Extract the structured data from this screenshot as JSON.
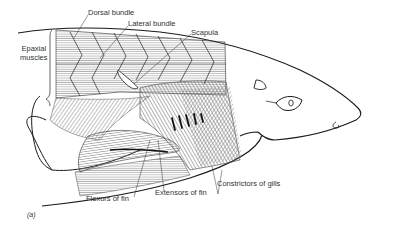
{
  "figure": {
    "panel_label": "(a)",
    "labels": {
      "dorsal_bundle": "Dorsal bundle",
      "lateral_bundle": "Lateral bundle",
      "scapula": "Scapula",
      "epaxial_muscles": "Epaxial muscles",
      "epaxial_line1": "Epaxial",
      "epaxial_line2": "muscles",
      "flexors_of_fin": "Flexors of fin",
      "extensors_of_fin": "Extensors of fin",
      "constrictors_of_gills": "Constrictors of gills"
    },
    "colors": {
      "line": "#1a1a1a",
      "hatch": "#555555",
      "text": "#333333",
      "background": "#ffffff"
    }
  }
}
